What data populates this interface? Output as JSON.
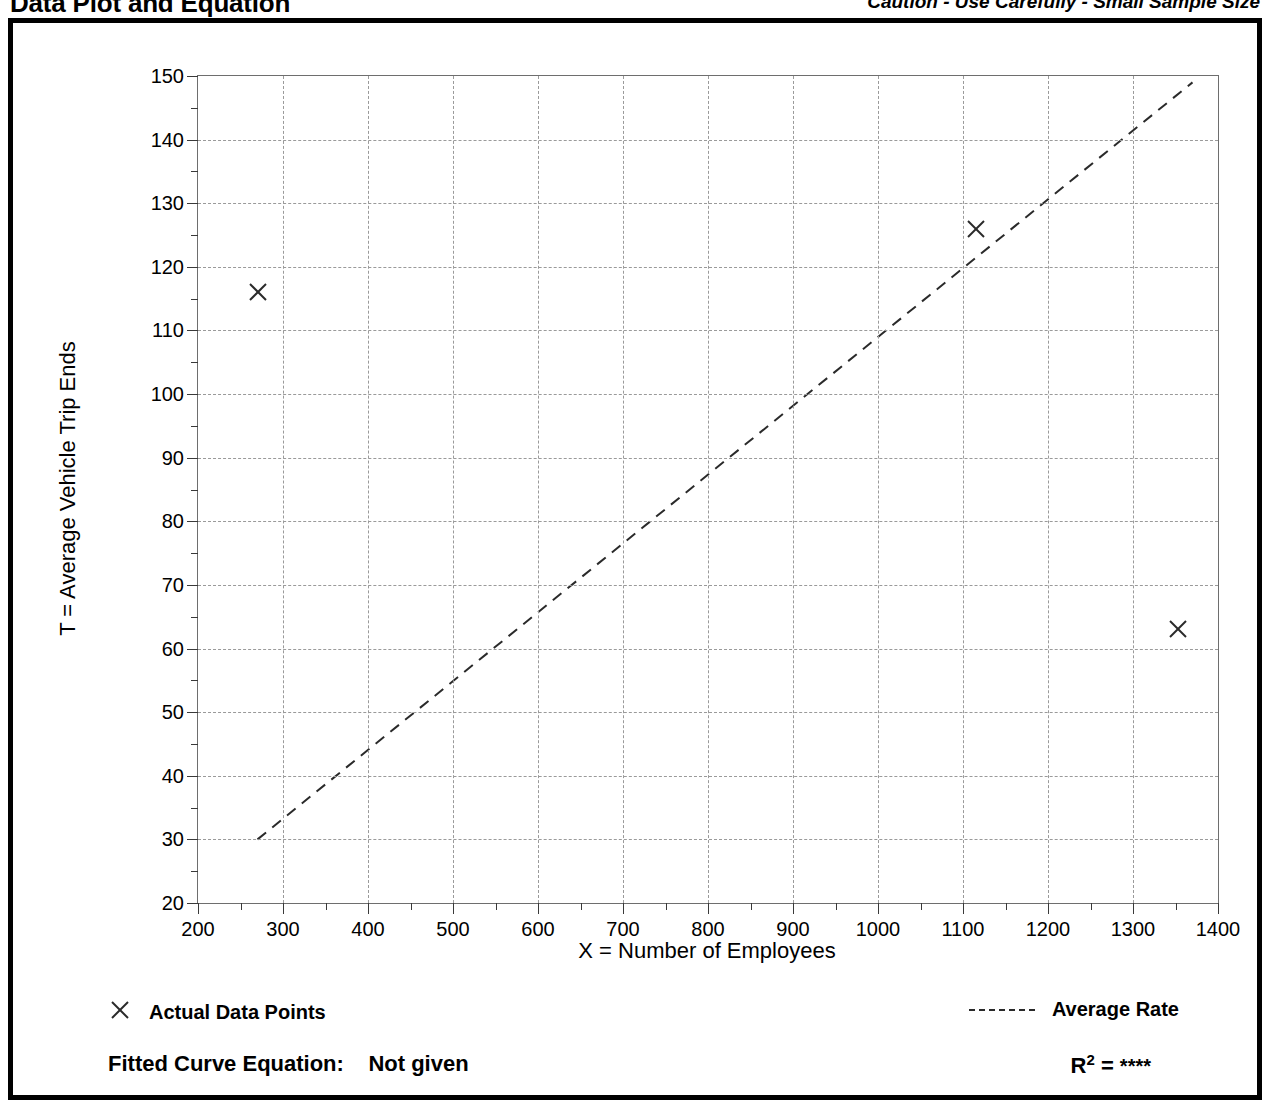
{
  "header": {
    "title": "Data Plot and Equation",
    "caution": "Caution - Use Carefully - Small Sample Size"
  },
  "legend": {
    "data_points_label": "Actual Data Points",
    "data_points_icon": "x-marker-icon",
    "average_rate_label": "Average Rate",
    "average_rate_icon": "dashed-line-icon"
  },
  "equation": {
    "fitted_curve_label": "Fitted Curve Equation:",
    "fitted_curve_value": "Not given",
    "r_squared_label": "R",
    "r_squared_exponent": "2",
    "r_squared_equals": "=",
    "r_squared_value": "****"
  },
  "colors": {
    "ink": "#000000",
    "grid": "#9a9a9a",
    "axis": "#6e6e6e",
    "marker": "#2a2a2a",
    "trend": "#2a2a2a"
  },
  "chart_data": {
    "type": "scatter",
    "title": "Data Plot and Equation",
    "xlabel": "X = Number of Employees",
    "ylabel": "T = Average Vehicle Trip Ends",
    "xlim": [
      200,
      1400
    ],
    "ylim": [
      20,
      150
    ],
    "xticks": [
      200,
      300,
      400,
      500,
      600,
      700,
      800,
      900,
      1000,
      1100,
      1200,
      1300,
      1400
    ],
    "yticks": [
      20,
      30,
      40,
      50,
      60,
      70,
      80,
      90,
      100,
      110,
      120,
      130,
      140,
      150
    ],
    "xtick_labels": [
      "200",
      "300",
      "400",
      "500",
      "600",
      "700",
      "800",
      "900",
      "1000",
      "1100",
      "1200",
      "1300",
      "1400"
    ],
    "ytick_labels": [
      "20",
      "30",
      "40",
      "50",
      "60",
      "70",
      "80",
      "90",
      "100",
      "110",
      "120",
      "130",
      "140",
      "150"
    ],
    "x_minor_interval": 50,
    "y_minor_interval": 5,
    "grid": true,
    "grid_style": "dashed",
    "legend_position": "below-plot",
    "series": [
      {
        "name": "Actual Data Points",
        "type": "scatter",
        "marker": "x",
        "points": [
          {
            "x": 270,
            "y": 116
          },
          {
            "x": 1115,
            "y": 126
          },
          {
            "x": 1353,
            "y": 63
          }
        ]
      },
      {
        "name": "Average Rate",
        "type": "line",
        "style": "dashed",
        "points": [
          {
            "x": 270,
            "y": 30
          },
          {
            "x": 1370,
            "y": 149
          }
        ]
      }
    ]
  }
}
